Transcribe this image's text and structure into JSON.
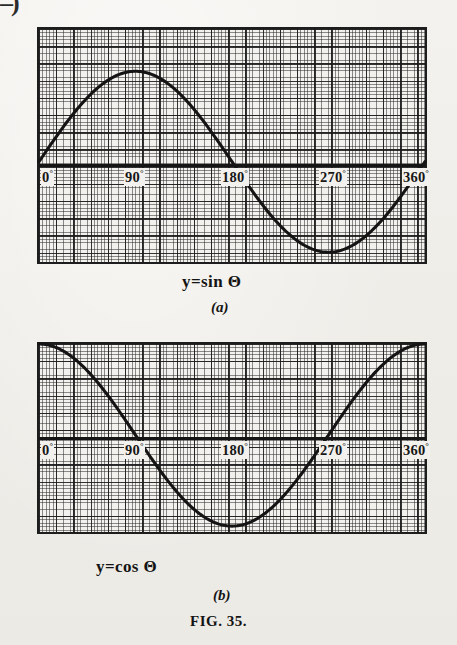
{
  "page": {
    "corner_mark": "–)",
    "figure_caption_small": "F",
    "figure_caption_rest": "IG",
    "figure_caption": "FIG. 35.",
    "background_color": "#f2f0ec",
    "ink_color": "#161616"
  },
  "charts": [
    {
      "id": "a",
      "equation": "y=sin Θ",
      "panel_label": "(a)",
      "tick_labels": [
        "0",
        "90",
        "180",
        "270",
        "360"
      ],
      "degree_symbol": "°"
    },
    {
      "id": "b",
      "equation": "y=cos Θ",
      "panel_label": "(b)",
      "tick_labels": [
        "0",
        "90",
        "180",
        "270",
        "360"
      ],
      "degree_symbol": "°"
    }
  ],
  "chart_data": [
    {
      "type": "line",
      "title": "y=sin Θ",
      "panel": "(a)",
      "xlabel": "Θ (degrees)",
      "ylabel": "y",
      "xlim": [
        0,
        360
      ],
      "ylim": [
        -1.07,
        1.57
      ],
      "grid": true,
      "legend": "none",
      "x_ticks": [
        0,
        90,
        180,
        270,
        360
      ],
      "x_tick_labels": [
        "0°",
        "90°",
        "180°",
        "270°",
        "360°"
      ],
      "axis_y_value": 0,
      "series": [
        {
          "name": "sin Θ",
          "x": [
            0,
            15,
            30,
            45,
            60,
            75,
            90,
            105,
            120,
            135,
            150,
            165,
            180,
            195,
            210,
            225,
            240,
            255,
            270,
            285,
            300,
            315,
            330,
            345,
            360
          ],
          "values": [
            0,
            0.259,
            0.5,
            0.707,
            0.866,
            0.966,
            1,
            0.966,
            0.866,
            0.707,
            0.5,
            0.259,
            0,
            -0.259,
            -0.5,
            -0.707,
            -0.866,
            -0.966,
            -1,
            -0.966,
            -0.866,
            -0.707,
            -0.5,
            -0.259,
            0
          ]
        }
      ],
      "annotations": [
        "maximum y = 1 at Θ = 90°",
        "zero crossings at 0°, 180°, 360°",
        "minimum y = -1 at Θ = 270°"
      ]
    },
    {
      "type": "line",
      "title": "y=cos Θ",
      "panel": "(b)",
      "xlabel": "Θ (degrees)",
      "ylabel": "y",
      "xlim": [
        0,
        360
      ],
      "ylim": [
        -1.0,
        1.0
      ],
      "grid": true,
      "legend": "none",
      "x_ticks": [
        0,
        90,
        180,
        270,
        360
      ],
      "x_tick_labels": [
        "0°",
        "90°",
        "180°",
        "270°",
        "360°"
      ],
      "axis_y_value": 0,
      "series": [
        {
          "name": "cos Θ",
          "x": [
            0,
            15,
            30,
            45,
            60,
            75,
            90,
            105,
            120,
            135,
            150,
            165,
            180,
            195,
            210,
            225,
            240,
            255,
            270,
            285,
            300,
            315,
            330,
            345,
            360
          ],
          "values": [
            1,
            0.966,
            0.866,
            0.707,
            0.5,
            0.259,
            0,
            -0.259,
            -0.5,
            -0.707,
            -0.866,
            -0.966,
            -1,
            -0.966,
            -0.866,
            -0.707,
            -0.5,
            -0.259,
            0,
            0.259,
            0.5,
            0.707,
            0.866,
            0.966,
            1
          ]
        }
      ],
      "annotations": [
        "maximum y = 1 at Θ = 0° and 360°",
        "zero crossings at 90° and 270°",
        "minimum y = -1 at Θ = 180°"
      ]
    }
  ]
}
